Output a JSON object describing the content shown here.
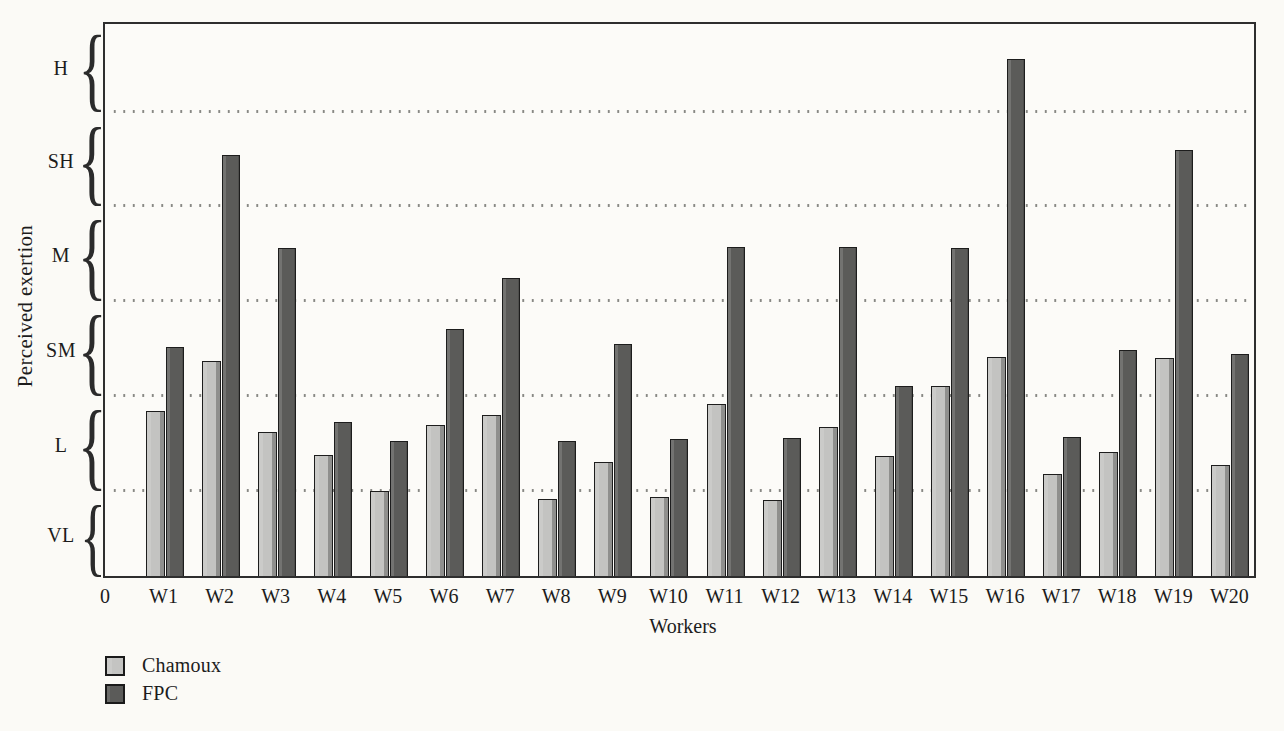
{
  "chart_data": {
    "type": "bar",
    "title": "",
    "xlabel": "Workers",
    "ylabel": "Perceived exertion",
    "origin_label": "0",
    "categories": [
      "W1",
      "W2",
      "W3",
      "W4",
      "W5",
      "W6",
      "W7",
      "W8",
      "W9",
      "W10",
      "W11",
      "W12",
      "W13",
      "W14",
      "W15",
      "W16",
      "W17",
      "W18",
      "W19",
      "W20"
    ],
    "y_band_labels_top_to_bottom": [
      "H",
      "SH",
      "M",
      "SM",
      "L",
      "VL"
    ],
    "value_scale": "band units: 1 = top of VL band, 2 = top of L, 3 = top of SM, 4 = top of M, 5 = top of SH, 6 = top of H",
    "ylim": [
      0,
      6
    ],
    "grid": "dotted horizontal lines at band boundaries",
    "legend_position": "bottom-left",
    "series": [
      {
        "name": "Chamoux",
        "color": "#c4c4c2",
        "values": [
          1.84,
          2.37,
          1.62,
          1.38,
          1.0,
          1.69,
          1.8,
          0.91,
          1.3,
          0.93,
          1.92,
          0.89,
          1.67,
          1.37,
          2.1,
          2.41,
          1.18,
          1.41,
          2.4,
          1.27
        ]
      },
      {
        "name": "FPC",
        "color": "#5b5b59",
        "values": [
          2.52,
          4.54,
          3.56,
          1.73,
          1.53,
          2.71,
          3.24,
          1.53,
          2.55,
          1.55,
          3.57,
          1.56,
          3.57,
          2.11,
          3.56,
          5.58,
          1.57,
          2.48,
          4.6,
          2.44
        ]
      }
    ]
  },
  "legend": {
    "items": [
      {
        "label": "Chamoux",
        "color": "#c4c4c2"
      },
      {
        "label": "FPC",
        "color": "#5b5b59"
      }
    ]
  },
  "colors": {
    "background": "#fbfaf6",
    "plot_border": "#2e2e2e",
    "grid_dot": "#878783",
    "text": "#1c1c1c",
    "bar_light_fill": "#c4c4c2",
    "bar_light_shadow": "#8f8f8d",
    "bar_dark_fill": "#5b5b59",
    "bar_outline": "#1d1d1d"
  }
}
